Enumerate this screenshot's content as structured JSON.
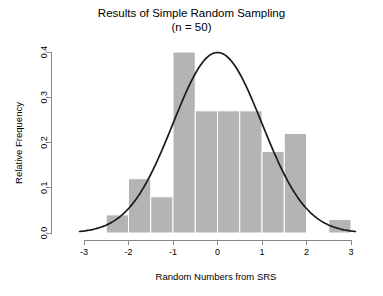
{
  "chart_data": {
    "type": "bar",
    "title": "Results of Simple Random Sampling",
    "subtitle": "(n = 50)",
    "xlabel": "Random Numbers from SRS",
    "ylabel": "Relative Frequency",
    "xlim": [
      -3.2,
      3.3
    ],
    "ylim": [
      0.0,
      0.43
    ],
    "xticks": [
      -3,
      -2,
      -1,
      0,
      1,
      2,
      3
    ],
    "xtick_labels": [
      "-3",
      "-2",
      "-1",
      "0",
      "1",
      "2",
      "3"
    ],
    "yticks": [
      0.0,
      0.1,
      0.2,
      0.3,
      0.4
    ],
    "ytick_labels": [
      "0.0",
      "0.1",
      "0.2",
      "0.3",
      "0.4"
    ],
    "grid": false,
    "legend": "none",
    "bin_width": 0.5,
    "bar_color": "#b4b4b4",
    "bar_border_color": "#ffffff",
    "bins": [
      {
        "x0": -2.5,
        "x1": -2.0,
        "value": 0.04
      },
      {
        "x0": -2.0,
        "x1": -1.5,
        "value": 0.12
      },
      {
        "x0": -1.5,
        "x1": -1.0,
        "value": 0.08
      },
      {
        "x0": -1.0,
        "x1": -0.5,
        "value": 0.4
      },
      {
        "x0": -0.5,
        "x1": 0.0,
        "value": 0.27
      },
      {
        "x0": 0.0,
        "x1": 0.5,
        "value": 0.27
      },
      {
        "x0": 0.5,
        "x1": 1.0,
        "value": 0.27
      },
      {
        "x0": 1.0,
        "x1": 1.5,
        "value": 0.18
      },
      {
        "x0": 1.5,
        "x1": 2.0,
        "value": 0.22
      },
      {
        "x0": 2.5,
        "x1": 3.0,
        "value": 0.03
      }
    ],
    "overlay_curve": {
      "name": "normal-density",
      "color": "#1a1a1a",
      "mean": 0.0,
      "sd": 1.0,
      "peak": 0.3989,
      "x_start": -3.1,
      "x_end": 3.1
    }
  }
}
